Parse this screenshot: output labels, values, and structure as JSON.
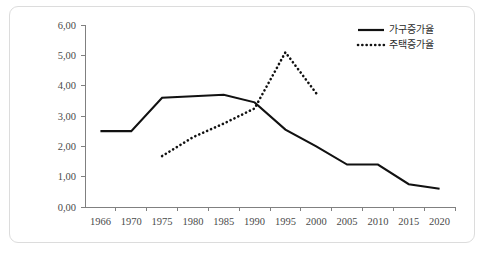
{
  "chart_data": {
    "type": "line",
    "title": "",
    "xlabel": "",
    "ylabel": "",
    "xlim": [
      1966,
      2020
    ],
    "ylim": [
      0,
      6
    ],
    "grid": false,
    "legend_position": "top-right",
    "x_tick_labels": [
      "1966",
      "1970",
      "1975",
      "1980",
      "1985",
      "1990",
      "1995",
      "2000",
      "2005",
      "2010",
      "2015",
      "2020"
    ],
    "x_ticks": [
      1966,
      1970,
      1975,
      1980,
      1985,
      1990,
      1995,
      2000,
      2005,
      2010,
      2015,
      2020
    ],
    "y_tick_labels": [
      "0,00",
      "1,00",
      "2,00",
      "3,00",
      "4,00",
      "5,00",
      "6,00"
    ],
    "y_ticks": [
      0,
      1,
      2,
      3,
      4,
      5,
      6
    ],
    "series": [
      {
        "name": "가구증가율",
        "style": "solid",
        "color": "#111111",
        "x": [
          1966,
          1970,
          1975,
          1980,
          1985,
          1990,
          1995,
          2000,
          2005,
          2010,
          2015,
          2020
        ],
        "values": [
          2.5,
          2.5,
          3.6,
          3.65,
          3.7,
          3.45,
          2.55,
          2.0,
          1.4,
          1.4,
          0.75,
          0.6
        ]
      },
      {
        "name": "주택증가율",
        "style": "dotted",
        "color": "#111111",
        "x": [
          1975,
          1980,
          1985,
          1990,
          1995,
          2000
        ],
        "values": [
          1.68,
          2.3,
          2.75,
          3.25,
          5.1,
          3.75
        ]
      }
    ]
  },
  "legend": {
    "items": [
      {
        "label": "가구증가율",
        "style": "solid"
      },
      {
        "label": "주택증가율",
        "style": "dotted"
      }
    ]
  }
}
